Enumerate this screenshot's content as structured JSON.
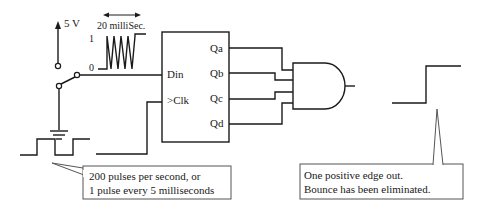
{
  "diagram": {
    "supply": {
      "label": "5 V"
    },
    "bounce_waveform": {
      "duration_label": "20 milliSec.",
      "high_label": "1",
      "low_label": "0"
    },
    "shift_register": {
      "inputs": [
        "Din",
        ">Clk"
      ],
      "outputs": [
        "Qa",
        "Qb",
        "Qc",
        "Qd"
      ]
    },
    "gate": {
      "type": "AND",
      "input_count": 4
    },
    "clock_callout": {
      "line1": "200 pulses per second, or",
      "line2": "1 pulse every 5 milliseconds"
    },
    "output_callout": {
      "line1": "One positive edge out.",
      "line2": "Bounce has been eliminated."
    },
    "colors": {
      "line": "#1a1a1a",
      "callout_border": "#555555",
      "background": "#ffffff"
    }
  }
}
